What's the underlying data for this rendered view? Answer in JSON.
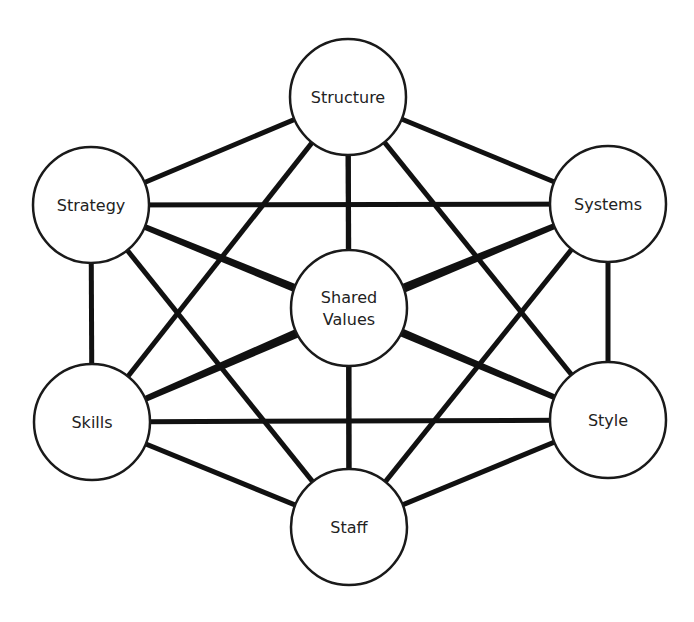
{
  "style": {
    "line_color": "#111111",
    "node_fill": "#ffffff",
    "node_stroke": "#1a1a1a",
    "text_color": "#222222"
  },
  "nodes": [
    {
      "id": "structure",
      "label": "Structure",
      "cx": 348,
      "cy": 97
    },
    {
      "id": "strategy",
      "label": "Strategy",
      "cx": 91,
      "cy": 205
    },
    {
      "id": "systems",
      "label": "Systems",
      "cx": 608,
      "cy": 204
    },
    {
      "id": "shared_values",
      "label": "Shared Values",
      "lines": [
        "Shared",
        "Values"
      ],
      "cx": 349,
      "cy": 308
    },
    {
      "id": "skills",
      "label": "Skills",
      "cx": 92,
      "cy": 422
    },
    {
      "id": "style",
      "label": "Style",
      "cx": 608,
      "cy": 420
    },
    {
      "id": "staff",
      "label": "Staff",
      "cx": 349,
      "cy": 527
    }
  ],
  "node_radius": 58,
  "edges": [
    [
      "structure",
      "strategy"
    ],
    [
      "structure",
      "systems"
    ],
    [
      "structure",
      "shared_values"
    ],
    [
      "structure",
      "skills"
    ],
    [
      "structure",
      "style"
    ],
    [
      "structure",
      "staff"
    ],
    [
      "strategy",
      "systems"
    ],
    [
      "strategy",
      "shared_values"
    ],
    [
      "strategy",
      "skills"
    ],
    [
      "strategy",
      "style"
    ],
    [
      "strategy",
      "staff"
    ],
    [
      "systems",
      "shared_values"
    ],
    [
      "systems",
      "skills"
    ],
    [
      "systems",
      "style"
    ],
    [
      "systems",
      "staff"
    ],
    [
      "shared_values",
      "skills"
    ],
    [
      "shared_values",
      "style"
    ],
    [
      "shared_values",
      "staff"
    ],
    [
      "skills",
      "style"
    ],
    [
      "skills",
      "staff"
    ],
    [
      "style",
      "staff"
    ]
  ]
}
